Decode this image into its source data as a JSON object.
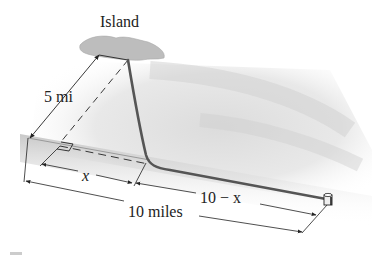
{
  "figure": {
    "labels": {
      "island": "Island",
      "offshore_distance": "5 mi",
      "x_segment": "x",
      "remaining_segment": "10 − x",
      "total_distance": "10 miles"
    },
    "colors": {
      "ink": "#222222",
      "cable": "#555555",
      "water_shadow": "#c8c8c8",
      "island": "#bdbdbd",
      "background": "#ffffff"
    },
    "icons": {
      "island": "island-shape",
      "terminal_post": "cable-terminal-post",
      "right_angle": "right-angle-marker"
    }
  }
}
